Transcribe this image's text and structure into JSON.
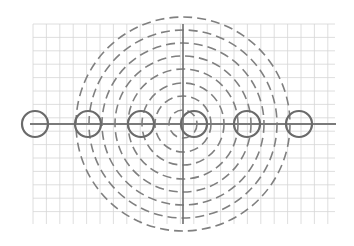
{
  "diagram": {
    "width": 354,
    "height": 246,
    "background": "#ffffff",
    "grid": {
      "x_start": 33,
      "x_end": 335,
      "y_start": 24,
      "y_end": 224,
      "spacing": 13.4,
      "color": "#d6d6d6",
      "stroke_width": 0.8
    },
    "center": {
      "x": 183,
      "y": 124
    },
    "horizontal_line": {
      "x1": 30,
      "x2": 336,
      "y": 124,
      "color": "#7a7a7a",
      "stroke_width": 2.2
    },
    "vertical_axis": {
      "x": 183,
      "y1": 24,
      "y2": 224,
      "color": "#6e6e6e",
      "stroke_width": 1.6
    },
    "concentric_dashed_circles": {
      "radii": [
        14,
        28,
        41,
        55,
        68,
        81,
        94,
        107
      ],
      "color": "#808080",
      "stroke_width": 1.6,
      "dash": "9 5"
    },
    "small_circles": {
      "radius": 13,
      "color": "#6a6a6a",
      "stroke_width": 2.2,
      "centers_x": [
        35,
        88,
        141,
        194,
        247,
        299
      ],
      "center_y": 124
    }
  }
}
